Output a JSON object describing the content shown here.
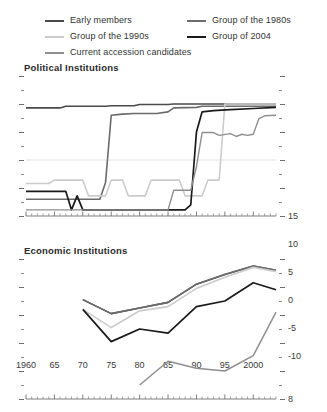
{
  "legend": {
    "left_items": [
      {
        "label": "Early members",
        "color": "#4a4a4a",
        "key": "early_members"
      },
      {
        "label": "Group of the 1990s",
        "color": "#cccccc",
        "key": "group_1990s"
      },
      {
        "label": "Current accession candidates",
        "color": "#8f8f8f",
        "key": "candidates"
      }
    ],
    "right_items": [
      {
        "label": "Group of the 1980s",
        "color": "#6b6b6b",
        "key": "group_1980s"
      },
      {
        "label": "Group of 2004",
        "color": "#1a1a1a",
        "key": "group_2004"
      }
    ]
  },
  "chart_data": [
    {
      "id": "political",
      "type": "line",
      "title": "Political Institutions",
      "xlabel": "",
      "ylabel": "",
      "xlim": [
        1960,
        2004
      ],
      "ylim": [
        -10,
        15
      ],
      "yticks": [
        -10,
        -5,
        0,
        5,
        10,
        15
      ],
      "ytick_labels": [
        "-10",
        "-5",
        "0",
        "5",
        "10",
        "15"
      ],
      "y_minor_step": 2.5,
      "xticks": [
        1960,
        1965,
        1970,
        1975,
        1980,
        1985,
        1990,
        1995,
        2000
      ],
      "xtick_labels": [
        "1960",
        "65",
        "70",
        "75",
        "80",
        "85",
        "90",
        "95",
        "2000"
      ],
      "x_minor_step": 1,
      "grid": false,
      "zero_line": 0,
      "legend_position": "top",
      "series": [
        {
          "name": "Early members",
          "color": "#4a4a4a",
          "width": 1.6,
          "x": [
            1960,
            1966,
            1967,
            1974,
            1975,
            1979,
            1980,
            1985,
            1986,
            2004
          ],
          "values": [
            9.3,
            9.3,
            9.6,
            9.6,
            9.7,
            9.7,
            9.9,
            9.9,
            10.0,
            10.0
          ]
        },
        {
          "name": "Group of the 1980s",
          "color": "#6b6b6b",
          "width": 1.6,
          "x": [
            1960,
            1973,
            1974,
            1975,
            1977,
            1979,
            1983,
            1985,
            1986,
            1990,
            1991,
            2004
          ],
          "values": [
            -7.0,
            -7.0,
            -4.0,
            8.0,
            8.2,
            8.3,
            8.3,
            8.6,
            9.3,
            9.4,
            9.6,
            9.6
          ]
        },
        {
          "name": "Group of the 1990s",
          "color": "#cccccc",
          "width": 1.6,
          "x": [
            1960,
            1964,
            1965,
            1970,
            1971,
            1974,
            1975,
            1977,
            1978,
            1981,
            1982,
            1987,
            1988,
            1991,
            1992,
            1994,
            1995,
            2004
          ],
          "values": [
            -4.2,
            -4.2,
            -3.6,
            -3.6,
            -6.4,
            -6.4,
            -3.6,
            -3.6,
            -6.4,
            -6.4,
            -3.6,
            -3.6,
            -6.4,
            -6.4,
            -3.6,
            -3.6,
            10.0,
            10.0
          ]
        },
        {
          "name": "Group of 2004",
          "color": "#1a1a1a",
          "width": 1.7,
          "x": [
            1960,
            1967,
            1968,
            1969,
            1970,
            1971,
            1973,
            1974,
            1988,
            1989,
            1990,
            1991,
            1993,
            1996,
            2000,
            2004
          ],
          "values": [
            -5.6,
            -5.6,
            -8.9,
            -6.4,
            -8.9,
            -8.9,
            -8.9,
            -8.9,
            -8.9,
            -8.0,
            5.0,
            8.6,
            8.8,
            9.0,
            9.2,
            9.4
          ]
        },
        {
          "name": "Current accession candidates",
          "color": "#8f8f8f",
          "width": 1.4,
          "x": [
            1960,
            1985,
            1986,
            1989,
            1990,
            1991,
            1993,
            1994,
            1996,
            1997,
            1998,
            1999,
            2000,
            2001,
            2002,
            2004
          ],
          "values": [
            -8.9,
            -8.9,
            -5.4,
            -5.4,
            -1.2,
            4.9,
            4.9,
            4.4,
            4.7,
            4.2,
            4.6,
            4.4,
            4.6,
            7.4,
            7.9,
            8.0
          ]
        }
      ]
    },
    {
      "id": "economic",
      "type": "line",
      "title": "Economic Institutions",
      "xlabel": "",
      "ylabel": "",
      "xlim": [
        1960,
        2004
      ],
      "ylim": [
        3,
        8
      ],
      "yticks": [
        3,
        4,
        5,
        6,
        7,
        8
      ],
      "ytick_labels": [
        "3",
        "4",
        "5",
        "6",
        "7",
        "8"
      ],
      "y_minor_step": 0.5,
      "xticks": [
        1960,
        1965,
        1970,
        1975,
        1980,
        1985,
        1990,
        1995,
        2000
      ],
      "xtick_labels": [
        "1960",
        "65",
        "70",
        "75",
        "80",
        "85",
        "90",
        "95",
        "2000"
      ],
      "x_minor_step": 1,
      "grid": false,
      "legend_position": "top",
      "series": [
        {
          "name": "Early members",
          "color": "#4a4a4a",
          "width": 1.6,
          "x": [
            1970,
            1975,
            1980,
            1985,
            1990,
            1995,
            2000,
            2004
          ],
          "values": [
            6.55,
            6.05,
            6.25,
            6.45,
            7.1,
            7.45,
            7.75,
            7.6
          ]
        },
        {
          "name": "Group of the 1980s",
          "color": "#6b6b6b",
          "width": 1.6,
          "x": [
            1970,
            1975,
            1980,
            1985,
            1990,
            1995,
            2000,
            2004
          ],
          "values": [
            6.55,
            6.05,
            6.25,
            6.45,
            7.1,
            7.45,
            7.75,
            7.6
          ]
        },
        {
          "name": "Group of the 1990s",
          "color": "#cccccc",
          "width": 1.7,
          "x": [
            1970,
            1975,
            1980,
            1985,
            1990,
            1995,
            2000,
            2004
          ],
          "values": [
            6.2,
            5.55,
            6.15,
            6.3,
            6.95,
            7.35,
            7.7,
            7.55
          ]
        },
        {
          "name": "Group of 2004",
          "color": "#1a1a1a",
          "width": 1.7,
          "x": [
            1970,
            1975,
            1980,
            1985,
            1990,
            1995,
            2000,
            2004
          ],
          "values": [
            6.2,
            5.05,
            5.5,
            5.35,
            6.3,
            6.5,
            7.15,
            6.9
          ]
        },
        {
          "name": "Current accession candidates",
          "color": "#8f8f8f",
          "width": 1.5,
          "x": [
            1980,
            1985,
            1990,
            1995,
            2000,
            2004
          ],
          "values": [
            3.5,
            4.35,
            4.1,
            4.0,
            4.55,
            6.1
          ]
        }
      ]
    }
  ]
}
